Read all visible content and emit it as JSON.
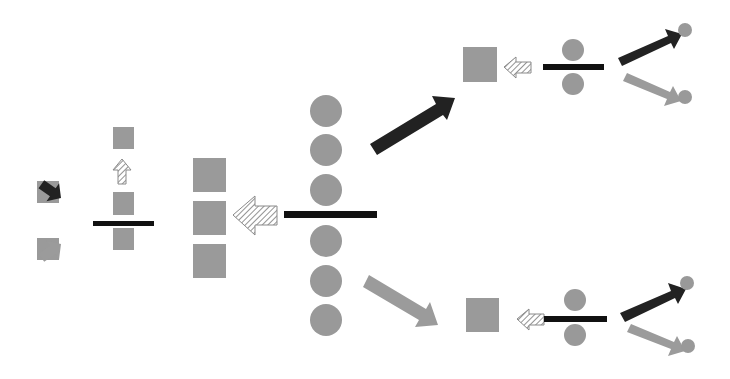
{
  "diagram": {
    "type": "schematic",
    "colors": {
      "background": "#ffffff",
      "shape_fill": "#999999",
      "bar": "#111111",
      "dark_arrow": "#222222",
      "gray_arrow": "#9b9b9b",
      "hatch_stroke": "#8a8a8a"
    },
    "groups": [
      {
        "name": "left-cluster",
        "elements": [
          "square-top",
          "hatch-arrow-up",
          "square-mid",
          "divider-bar",
          "square-bottom",
          "dark-arrow-nw",
          "gray-arrow-sw",
          "output-square-upper",
          "output-square-lower"
        ]
      },
      {
        "name": "center-cluster",
        "elements": [
          "three-stacked-squares",
          "hatch-arrow-left",
          "divider-bar",
          "six-circles-column",
          "dark-arrow-ne",
          "gray-arrow-se"
        ]
      },
      {
        "name": "top-right-cluster",
        "elements": [
          "square",
          "hatch-arrow-left",
          "divider-bar",
          "two-circles",
          "dark-arrow-ne",
          "gray-arrow-se",
          "two-small-circles"
        ]
      },
      {
        "name": "bottom-right-cluster",
        "elements": [
          "square",
          "hatch-arrow-left",
          "divider-bar",
          "two-circles",
          "dark-arrow-ne",
          "gray-arrow-se",
          "two-small-circles"
        ]
      }
    ]
  }
}
